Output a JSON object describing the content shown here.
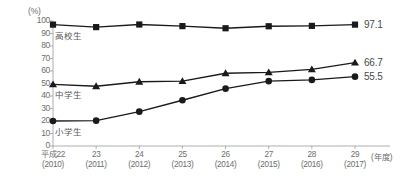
{
  "chart_data": {
    "type": "line",
    "title": "",
    "xlabel": "(年度)",
    "ylabel": "(%)",
    "ylim": [
      0,
      100
    ],
    "yticks": [
      "100",
      "90",
      "80",
      "70",
      "60",
      "50",
      "40",
      "30",
      "20",
      "10",
      "0"
    ],
    "grid": false,
    "legend_position": "inline-left",
    "categories": [
      "平成22",
      "23",
      "24",
      "25",
      "26",
      "27",
      "28",
      "29"
    ],
    "category_sub": [
      "(2010)",
      "(2011)",
      "(2012)",
      "(2013)",
      "(2014)",
      "(2015)",
      "(2016)",
      "(2017)"
    ],
    "series": [
      {
        "name": "高校生",
        "marker": "square",
        "color": "#1a1a1a",
        "end_value": "97.1",
        "values": [
          97.1,
          95.1,
          97.2,
          95.9,
          94.2,
          95.8,
          96.1,
          97.1
        ]
      },
      {
        "name": "中学生",
        "marker": "triangle",
        "color": "#1a1a1a",
        "end_value": "66.7",
        "values": [
          49.3,
          47.8,
          51.4,
          51.9,
          58.2,
          58.9,
          61.3,
          66.7
        ]
      },
      {
        "name": "小学生",
        "marker": "circle",
        "color": "#1a1a1a",
        "end_value": "55.5",
        "values": [
          20.0,
          20.3,
          27.5,
          36.6,
          45.9,
          51.9,
          52.9,
          55.5
        ]
      }
    ]
  },
  "axis_colors": {
    "axis_line": "#9a9a9a",
    "tick_text": "#6e6e6e",
    "series_line": "#1a1a1a",
    "value_text": "#4a4a4a"
  }
}
